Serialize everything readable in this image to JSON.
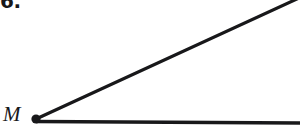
{
  "figure": {
    "problem_number": "6.",
    "background_color": "#ffffff",
    "ink_color": "#18181a",
    "canvas": {
      "width": 300,
      "height": 139
    },
    "vertex": {
      "label": "M",
      "name": "vertex-point-M",
      "x": 36,
      "y": 119,
      "dot_radius": 4.6
    },
    "rays": [
      {
        "name": "upper-ray",
        "from_x": 36,
        "from_y": 119,
        "to_x": 299,
        "to_y": -2,
        "stroke_width": 3.2
      },
      {
        "name": "lower-ray",
        "from_x": 36,
        "from_y": 121.5,
        "to_x": 301,
        "to_y": 123,
        "stroke_width": 3.4
      }
    ]
  }
}
